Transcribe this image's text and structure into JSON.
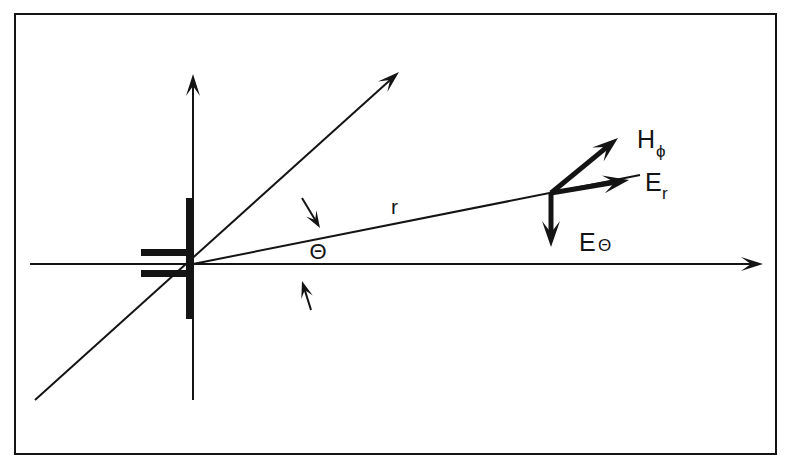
{
  "figure": {
    "background_color": "#ffffff",
    "ink_color": "#141414",
    "frame": {
      "name": "border-frame",
      "x": 15,
      "y": 14,
      "width": 761,
      "height": 440,
      "stroke_width": 2
    },
    "width": 791,
    "height": 469
  },
  "geometry": {
    "origin": {
      "x": 193,
      "y": 264
    },
    "field_point": {
      "x": 551,
      "y": 193
    },
    "theta_degrees": 11
  },
  "axes": [
    {
      "name": "horizontal-axis",
      "label": "",
      "x1": 30,
      "y1": 264,
      "x2": 763,
      "y2": 264,
      "arrow_end": true,
      "stroke_width": 2
    },
    {
      "name": "vertical-axis",
      "label": "",
      "x1": 193,
      "y1": 400,
      "x2": 193,
      "y2": 74,
      "arrow_end": true,
      "stroke_width": 2
    },
    {
      "name": "diagonal-reference-axis",
      "label": "",
      "x1": 35,
      "y1": 400,
      "x2": 399,
      "y2": 72,
      "arrow_end": true,
      "stroke_width": 2
    }
  ],
  "radial_line": {
    "name": "radius-line",
    "x1": 193,
    "y1": 264,
    "x2": 640,
    "y2": 175,
    "stroke_width": 2,
    "label": "r",
    "label_x": 391,
    "label_y": 214
  },
  "antenna": {
    "name": "dipole-antenna",
    "vertical_bar": {
      "x": 186,
      "y": 198,
      "width": 8,
      "height": 121
    },
    "stubs": [
      {
        "name": "antenna-stub-upper",
        "x": 141,
        "y": 249,
        "width": 52,
        "height": 7
      },
      {
        "name": "antenna-stub-lower",
        "x": 141,
        "y": 270,
        "width": 52,
        "height": 7
      }
    ]
  },
  "angle_marker": {
    "name": "theta-angle-marker",
    "symbol": "Θ",
    "symbol_x": 318,
    "symbol_y": 259,
    "symbol_font_size": 22,
    "arrows": [
      {
        "name": "theta-arrow-upper",
        "x1": 302,
        "y1": 198,
        "x2": 320,
        "y2": 228
      },
      {
        "name": "theta-arrow-lower",
        "x1": 311,
        "y1": 310,
        "x2": 302,
        "y2": 281
      }
    ]
  },
  "vectors": [
    {
      "name": "h-phi-vector",
      "symbol": "H",
      "subscript": "ϕ",
      "x1": 551,
      "y1": 193,
      "x2": 618,
      "y2": 138,
      "label_x": 637,
      "label_y": 148,
      "sub_dx": 19,
      "sub_dy": 9,
      "stroke_width": 5
    },
    {
      "name": "e-r-vector",
      "symbol": "E",
      "subscript": "r",
      "x1": 551,
      "y1": 193,
      "x2": 629,
      "y2": 180,
      "label_x": 645,
      "label_y": 191,
      "sub_dx": 17,
      "sub_dy": 8,
      "stroke_width": 5
    },
    {
      "name": "e-theta-vector",
      "symbol": "E",
      "subscript": "Θ",
      "x1": 551,
      "y1": 193,
      "x2": 551,
      "y2": 247,
      "label_x": 579,
      "label_y": 251,
      "sub_dx": 19,
      "sub_dy": 0,
      "stroke_width": 5
    }
  ]
}
